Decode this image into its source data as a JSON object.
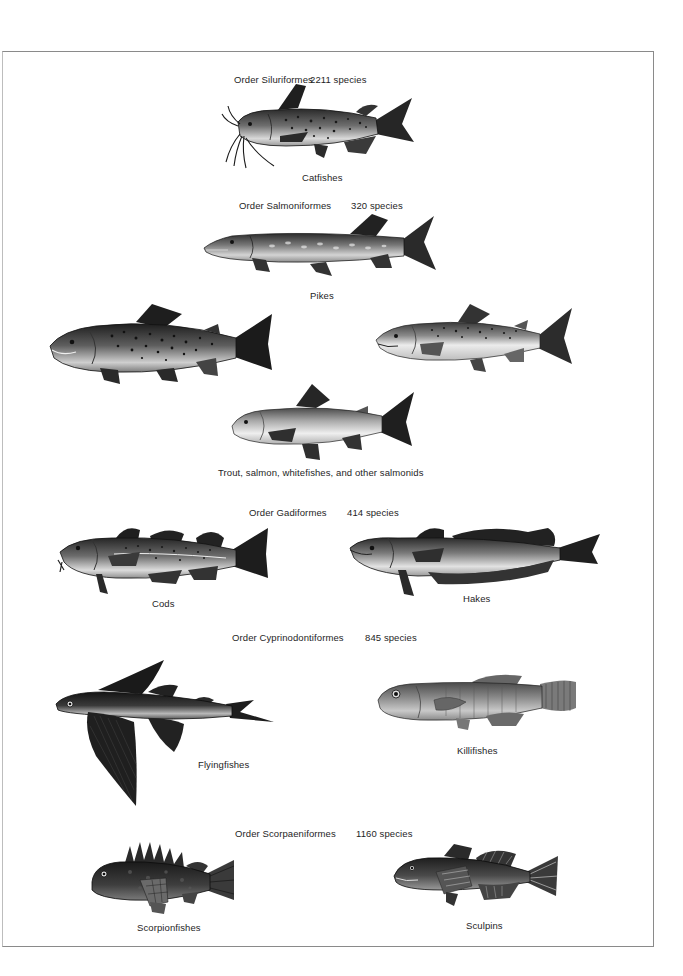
{
  "orders": [
    {
      "order_label": "Order Siluriformes",
      "species_count": "2211 species",
      "groups": [
        {
          "name": "Catfishes"
        }
      ]
    },
    {
      "order_label": "Order Salmoniformes",
      "species_count": "320 species",
      "groups": [
        {
          "name": "Pikes"
        },
        {
          "name": "Trout, salmon, whitefishes, and other salmonids"
        }
      ]
    },
    {
      "order_label": "Order Gadiformes",
      "species_count": "414 species",
      "groups": [
        {
          "name": "Cods"
        },
        {
          "name": "Hakes"
        }
      ]
    },
    {
      "order_label": "Order Cyprinodontiformes",
      "species_count": "845 species",
      "groups": [
        {
          "name": "Flyingfishes"
        },
        {
          "name": "Killifishes"
        }
      ]
    },
    {
      "order_label": "Order Scorpaeniformes",
      "species_count": "1160 species",
      "groups": [
        {
          "name": "Scorpionfishes"
        },
        {
          "name": "Sculpins"
        }
      ]
    }
  ],
  "illustrations": {
    "catfish": "catfish-illustration",
    "pike": "pike-illustration",
    "trout": "trout-illustration",
    "salmon": "salmon-illustration",
    "whitefish": "whitefish-illustration",
    "cod": "cod-illustration",
    "hake": "hake-illustration",
    "flyingfish": "flyingfish-illustration",
    "killifish": "killifish-illustration",
    "scorpionfish": "scorpionfish-illustration",
    "sculpin": "sculpin-illustration"
  },
  "colors": {
    "ink": "#1e1e1e",
    "frame": "#8a8a8a",
    "background": "#ffffff"
  }
}
